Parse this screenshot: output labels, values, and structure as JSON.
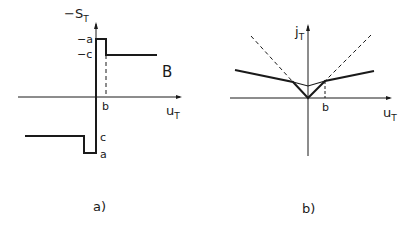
{
  "panel_a": {
    "caption": "a)",
    "y_axis_label": "−S",
    "y_axis_sub": "T",
    "x_axis_label": "u",
    "x_axis_sub": "T",
    "tick_neg_a": "−a",
    "tick_neg_c": "−c",
    "tick_b": "b",
    "tick_c": "c",
    "tick_a": "a",
    "region_label": "B"
  },
  "panel_b": {
    "caption": "b)",
    "y_axis_label": "j",
    "y_axis_sub": "T",
    "x_axis_label": "u",
    "x_axis_sub": "T",
    "tick_b": "b"
  },
  "colors": {
    "ink": "#1a1a1a",
    "background": "#ffffff"
  }
}
